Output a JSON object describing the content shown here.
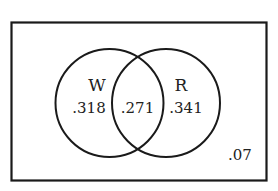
{
  "diagram": {
    "type": "venn",
    "universe": {
      "label": "",
      "outside_value": ".07"
    },
    "sets": [
      {
        "name": "W",
        "only_value": ".318"
      },
      {
        "name": "R",
        "only_value": ".341"
      }
    ],
    "intersection_value": ".271",
    "colors": {
      "stroke": "#1a1a1a",
      "text": "#222222",
      "background": "#ffffff"
    }
  }
}
